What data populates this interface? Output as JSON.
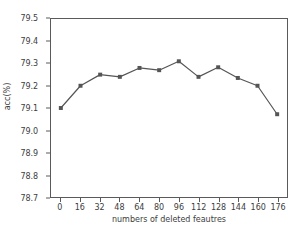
{
  "chart_data": {
    "type": "line",
    "title": "",
    "xlabel": "numbers of deleted feautres",
    "ylabel": "acc(%)",
    "x": [
      0,
      16,
      32,
      48,
      64,
      80,
      96,
      112,
      128,
      144,
      160,
      176
    ],
    "values": [
      79.1,
      79.2,
      79.25,
      79.24,
      79.28,
      79.27,
      79.31,
      79.24,
      79.283,
      79.235,
      79.2,
      79.072
    ],
    "xlim": [
      -8,
      184
    ],
    "ylim": [
      78.7,
      79.5
    ],
    "xticks": [
      "0",
      "16",
      "32",
      "48",
      "64",
      "80",
      "96",
      "112",
      "128",
      "144",
      "160",
      "176"
    ],
    "yticks": [
      "78.7",
      "78.8",
      "78.9",
      "79.0",
      "79.1",
      "79.2",
      "79.3",
      "79.4",
      "79.5"
    ],
    "ytick_values": [
      78.7,
      78.8,
      78.9,
      79.0,
      79.1,
      79.2,
      79.3,
      79.4,
      79.5
    ],
    "grid": false,
    "legend": null,
    "series_color": "#555555",
    "marker": "square",
    "axis_color": "#5a5a5a",
    "background": "#ffffff"
  }
}
